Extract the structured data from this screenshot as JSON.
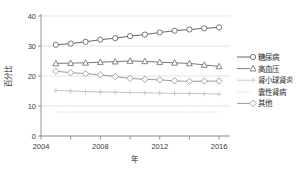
{
  "chart_data": {
    "type": "line",
    "title": "",
    "xlabel": "年",
    "ylabel": "百分比",
    "x": [
      2005,
      2006,
      2007,
      2008,
      2009,
      2010,
      2011,
      2012,
      2013,
      2014,
      2015,
      2016
    ],
    "xlim": [
      2004,
      2016.6
    ],
    "ylim": [
      0,
      40
    ],
    "xticks": [
      2004,
      2008,
      2012,
      2016
    ],
    "xtick_labels": [
      "2004",
      "2008",
      "2012",
      "2016"
    ],
    "yticks": [
      0,
      10,
      20,
      30,
      40
    ],
    "ytick_labels": [
      "0",
      "10",
      "20",
      "30",
      "40"
    ],
    "grid": true,
    "legend_position": "right",
    "series": [
      {
        "name": "糖尿病",
        "marker": "circle",
        "color": "#555555",
        "values": [
          30.4,
          30.8,
          31.4,
          32.1,
          32.6,
          33.3,
          33.8,
          34.5,
          35.1,
          35.5,
          35.9,
          36.2
        ]
      },
      {
        "name": "高血压",
        "marker": "triangle",
        "color": "#6b6b6b",
        "values": [
          24.2,
          24.3,
          24.4,
          24.6,
          24.8,
          25.0,
          24.9,
          24.6,
          24.4,
          24.2,
          23.7,
          23.2
        ]
      },
      {
        "name": "肾小球肾炎",
        "marker": "plus",
        "color": "#c2c2c2",
        "values": [
          15.2,
          15.0,
          14.8,
          14.7,
          14.6,
          14.5,
          14.4,
          14.3,
          14.2,
          14.2,
          14.1,
          14.0
        ]
      },
      {
        "name": "囊性肾病",
        "marker": "none",
        "color": "#e8e8e8",
        "values": [
          8.0,
          8.0,
          8.0,
          8.0,
          8.0,
          8.0,
          8.0,
          8.0,
          8.0,
          8.0,
          8.0,
          8.0
        ]
      },
      {
        "name": "其他",
        "marker": "diamond",
        "color": "#8f8f8f",
        "values": [
          21.6,
          21.1,
          20.8,
          20.4,
          19.8,
          19.2,
          18.9,
          18.7,
          18.4,
          18.2,
          18.3,
          18.3
        ]
      }
    ]
  }
}
